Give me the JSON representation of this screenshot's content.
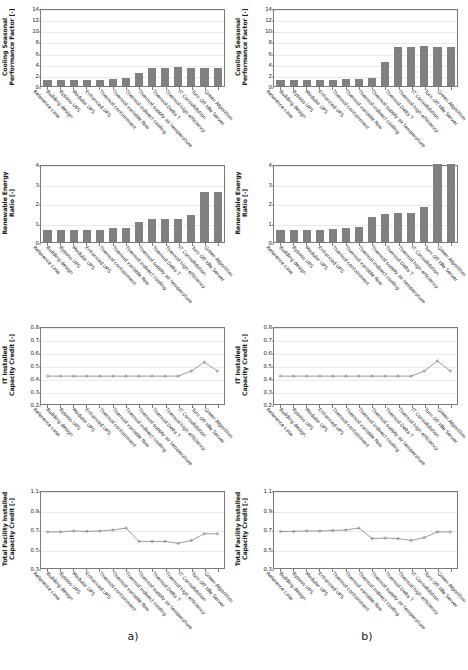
{
  "figure": {
    "captions": [
      {
        "id": "caption-a",
        "label": "a)"
      },
      {
        "id": "caption-b",
        "label": "b)"
      }
    ],
    "categories": [
      "Reference case",
      "Building design",
      "Bypass UPS",
      "Modular UPS",
      "Enhanced UPS",
      "Thermal containment",
      "Thermal variable flow",
      "Thermal indirect cooling",
      "Thermal supply air temperature",
      "Thermal Delta T",
      "Thermal high efficiency",
      "IT Consolidation",
      "Turn Off Idle Server",
      "Green Algorithm"
    ],
    "colors": {
      "bar": "#808080",
      "line": "#808080",
      "marker": "#808080",
      "axis": "#7a7a7a",
      "grid": "#e9e9e9"
    }
  },
  "chart_data": [
    {
      "id": "cspf-a",
      "panel": "a",
      "row": 1,
      "type": "bar",
      "title": "",
      "ylabel": "Cooling Seasonal\nPerformance Factor [-]",
      "xlabel": "",
      "ylim": [
        0,
        14
      ],
      "yticks": [
        0,
        2,
        4,
        6,
        8,
        10,
        12,
        14
      ],
      "grid": true,
      "categories": [
        "Reference case",
        "Building design",
        "Bypass UPS",
        "Modular UPS",
        "Enhanced UPS",
        "Thermal containment",
        "Thermal variable flow",
        "Thermal indirect cooling",
        "Thermal supply air temperature",
        "Thermal Delta T",
        "Thermal high efficiency",
        "IT Consolidation",
        "Turn Off Idle Server",
        "Green Algorithm"
      ],
      "values": [
        1.1,
        1.1,
        1.1,
        1.1,
        1.1,
        1.2,
        1.4,
        2.4,
        3.2,
        3.2,
        3.4,
        3.2,
        3.2,
        3.2
      ]
    },
    {
      "id": "cspf-b",
      "panel": "b",
      "row": 1,
      "type": "bar",
      "title": "",
      "ylabel": "Cooling Seasonal\nPerformance Factor [-]",
      "xlabel": "",
      "ylim": [
        0,
        14
      ],
      "yticks": [
        0,
        2,
        4,
        6,
        8,
        10,
        12,
        14
      ],
      "grid": true,
      "categories": [
        "Reference case",
        "Building design",
        "Bypass UPS",
        "Modular UPS",
        "Enhanced UPS",
        "Thermal containment",
        "Thermal variable flow",
        "Thermal indirect cooling",
        "Thermal supply air temperature",
        "Thermal Delta T",
        "Thermal high efficiency",
        "IT Consolidation",
        "Turn Off Idle Server",
        "Green Algorithm"
      ],
      "values": [
        1.1,
        1.1,
        1.1,
        1.1,
        1.1,
        1.2,
        1.3,
        1.4,
        4.3,
        7.0,
        7.0,
        7.1,
        7.0,
        7.0
      ]
    },
    {
      "id": "rer-a",
      "panel": "a",
      "row": 2,
      "type": "bar",
      "title": "",
      "ylabel": "Renewable Energy\nRatio [-]",
      "xlabel": "",
      "ylim": [
        0,
        4
      ],
      "yticks": [
        0,
        1,
        2,
        3,
        4
      ],
      "grid": true,
      "categories": [
        "Reference case",
        "Building design",
        "Bypass UPS",
        "Modular UPS",
        "Enhanced UPS",
        "Thermal containment",
        "Thermal variable flow",
        "Thermal indirect cooling",
        "Thermal supply air temperature",
        "Thermal Delta T",
        "Thermal high efficiency",
        "IT Consolidation",
        "Turn Off Idle Server",
        "Green Algorithm"
      ],
      "values": [
        0.63,
        0.63,
        0.64,
        0.64,
        0.64,
        0.7,
        0.74,
        1.03,
        1.16,
        1.17,
        1.18,
        1.38,
        2.57,
        2.57
      ]
    },
    {
      "id": "rer-b",
      "panel": "b",
      "row": 2,
      "type": "bar",
      "title": "",
      "ylabel": "Renewable Energy\nRatio [-]",
      "xlabel": "",
      "ylim": [
        0,
        4
      ],
      "yticks": [
        0,
        1,
        2,
        3,
        4
      ],
      "grid": true,
      "categories": [
        "Reference case",
        "Building design",
        "Bypass UPS",
        "Modular UPS",
        "Enhanced UPS",
        "Thermal containment",
        "Thermal variable flow",
        "Thermal indirect cooling",
        "Thermal supply air temperature",
        "Thermal Delta T",
        "Thermal high efficiency",
        "IT Consolidation",
        "Turn Off Idle Server",
        "Green Algorithm"
      ],
      "values": [
        0.63,
        0.63,
        0.64,
        0.64,
        0.65,
        0.72,
        0.76,
        1.3,
        1.45,
        1.48,
        1.5,
        1.78,
        4.0,
        4.0
      ]
    },
    {
      "id": "it-cap-a",
      "panel": "a",
      "row": 3,
      "type": "line",
      "title": "",
      "ylabel": "IT Installed\nCapacity Credit [-]",
      "xlabel": "",
      "ylim": [
        0.2,
        0.8
      ],
      "yticks": [
        0.2,
        0.3,
        0.4,
        0.5,
        0.6,
        0.7,
        0.8
      ],
      "grid": true,
      "categories": [
        "Reference case",
        "Building design",
        "Bypass UPS",
        "Modular UPS",
        "Enhanced UPS",
        "Thermal containment",
        "Thermal variable flow",
        "Thermal indirect cooling",
        "Thermal supply air temperature",
        "Thermal Delta T",
        "Thermal high efficiency",
        "IT Consolidation",
        "Turn Off Idle Server",
        "Green Algorithm"
      ],
      "values": [
        0.42,
        0.42,
        0.42,
        0.42,
        0.42,
        0.42,
        0.42,
        0.42,
        0.42,
        0.42,
        0.42,
        0.46,
        0.53,
        0.46
      ]
    },
    {
      "id": "it-cap-b",
      "panel": "b",
      "row": 3,
      "type": "line",
      "title": "",
      "ylabel": "IT Installed\nCapacity Credit [-]",
      "xlabel": "",
      "ylim": [
        0.2,
        0.8
      ],
      "yticks": [
        0.2,
        0.3,
        0.4,
        0.5,
        0.6,
        0.7,
        0.8
      ],
      "grid": true,
      "categories": [
        "Reference case",
        "Building design",
        "Bypass UPS",
        "Modular UPS",
        "Enhanced UPS",
        "Thermal containment",
        "Thermal variable flow",
        "Thermal indirect cooling",
        "Thermal supply air temperature",
        "Thermal Delta T",
        "Thermal high efficiency",
        "IT Consolidation",
        "Turn Off Idle Server",
        "Green Algorithm"
      ],
      "values": [
        0.42,
        0.42,
        0.42,
        0.42,
        0.42,
        0.42,
        0.42,
        0.42,
        0.42,
        0.42,
        0.42,
        0.46,
        0.54,
        0.46
      ]
    },
    {
      "id": "total-cap-a",
      "panel": "a",
      "row": 4,
      "type": "line",
      "title": "",
      "ylabel": "Total Facility Installed\nCapacity Credit [-]",
      "xlabel": "",
      "ylim": [
        0.3,
        1.1
      ],
      "yticks": [
        0.3,
        0.5,
        0.7,
        0.9,
        1.1
      ],
      "grid": true,
      "categories": [
        "Reference case",
        "Building design",
        "Bypass UPS",
        "Modular UPS",
        "Enhanced UPS",
        "Thermal containment",
        "Thermal variable flow",
        "Thermal indirect cooling",
        "Thermal supply air temperature",
        "Thermal Delta T",
        "Thermal high efficiency",
        "IT Consolidation",
        "Turn Off Idle Server",
        "Green Algorithm"
      ],
      "values": [
        0.68,
        0.68,
        0.69,
        0.685,
        0.69,
        0.7,
        0.72,
        0.58,
        0.58,
        0.58,
        0.56,
        0.59,
        0.66,
        0.66
      ]
    },
    {
      "id": "total-cap-b",
      "panel": "b",
      "row": 4,
      "type": "line",
      "title": "",
      "ylabel": "Total Facility Installed\nCapacity Credit [-]",
      "xlabel": "",
      "ylim": [
        0.3,
        1.1
      ],
      "yticks": [
        0.3,
        0.5,
        0.7,
        0.9,
        1.1
      ],
      "grid": true,
      "categories": [
        "Reference case",
        "Building design",
        "Bypass UPS",
        "Modular UPS",
        "Enhanced UPS",
        "Thermal containment",
        "Thermal variable flow",
        "Thermal indirect cooling",
        "Thermal supply air temperature",
        "Thermal Delta T",
        "Thermal high efficiency",
        "IT Consolidation",
        "Turn Off Idle Server",
        "Green Algorithm"
      ],
      "values": [
        0.685,
        0.685,
        0.69,
        0.69,
        0.695,
        0.7,
        0.72,
        0.61,
        0.615,
        0.61,
        0.59,
        0.62,
        0.68,
        0.68
      ]
    }
  ]
}
